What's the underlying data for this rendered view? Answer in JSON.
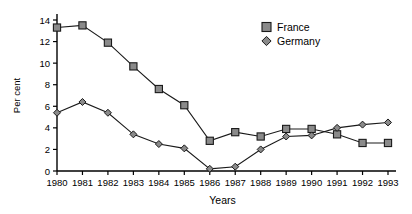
{
  "chart_data": {
    "type": "line",
    "title": "",
    "xlabel": "Years",
    "ylabel": "Per cent",
    "categories": [
      "1980",
      "1981",
      "1982",
      "1983",
      "1984",
      "1985",
      "1986",
      "1987",
      "1988",
      "1989",
      "1990",
      "1991",
      "1992",
      "1993"
    ],
    "x": [
      1980,
      1981,
      1982,
      1983,
      1984,
      1985,
      1986,
      1987,
      1988,
      1989,
      1990,
      1991,
      1992,
      1993
    ],
    "xlim": [
      1980,
      1993
    ],
    "ylim": [
      0,
      14
    ],
    "yticks": [
      0,
      2,
      4,
      6,
      8,
      10,
      12,
      14
    ],
    "ytick_labels": [
      "0",
      "2",
      "4",
      "6",
      "8",
      "10",
      "12",
      "14"
    ],
    "grid": false,
    "legend_position": "top-right",
    "series": [
      {
        "name": "France",
        "marker": "square",
        "color": "#8a8a8a",
        "values": [
          13.3,
          13.5,
          11.9,
          9.7,
          7.6,
          6.1,
          2.8,
          3.6,
          3.2,
          3.9,
          3.9,
          3.4,
          2.6,
          2.6
        ]
      },
      {
        "name": "Germany",
        "marker": "diamond",
        "color": "#8a8a8a",
        "values": [
          5.4,
          6.4,
          5.4,
          3.4,
          2.5,
          2.1,
          0.2,
          0.4,
          2.0,
          3.2,
          3.3,
          4.0,
          4.3,
          4.5
        ]
      }
    ]
  },
  "legend": {
    "items": [
      {
        "label": "France",
        "marker": "square"
      },
      {
        "label": "Germany",
        "marker": "diamond"
      }
    ]
  },
  "axes": {
    "y_title": "Per cent",
    "x_title": "Years"
  }
}
